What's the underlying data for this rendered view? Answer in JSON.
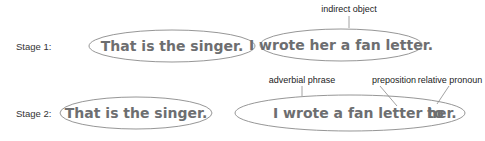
{
  "diagram": {
    "stages": [
      {
        "label": "Stage 1:",
        "left_sentence": "That is the singer.",
        "right_sentence": "I wrote her a fan letter.",
        "annotations": [
          {
            "text": "indirect object",
            "points_to": "her"
          }
        ]
      },
      {
        "label": "Stage 2:",
        "left_sentence": "That is the singer.",
        "right_sentence_part1": "I wrote a fan letter to",
        "right_sentence_part2": "her.",
        "annotations": [
          {
            "text": "adverbial phrase",
            "points_to": "sentence"
          },
          {
            "text": "preposition",
            "points_to": "to"
          },
          {
            "text": "relative pronoun",
            "points_to": "her"
          }
        ]
      }
    ],
    "colors": {
      "sentence_text": "#6d6e70",
      "ellipse_stroke": "#8a8a8a",
      "label_text": "#333333"
    }
  }
}
